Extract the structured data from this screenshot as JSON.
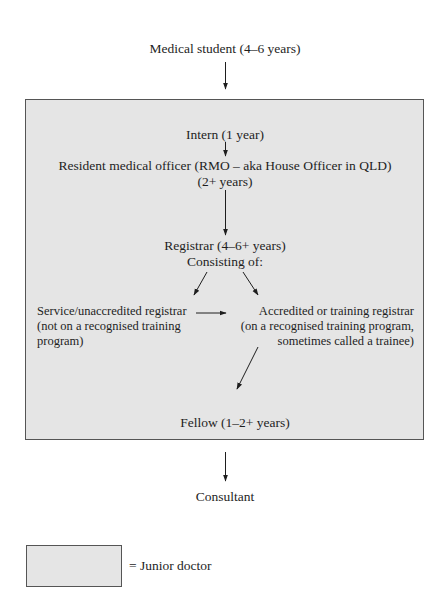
{
  "diagram": {
    "nodes": {
      "medical_student": "Medical student (4–6 years)",
      "intern": "Intern (1 year)",
      "rmo_line1": "Resident medical officer (RMO – aka House Officer in QLD)",
      "rmo_line2": "(2+ years)",
      "registrar_line1": "Registrar (4–6+ years)",
      "registrar_line2": "Consisting of:",
      "service_registrar": [
        "Service/unaccredited registrar",
        "(not on a recognised training",
        "program)"
      ],
      "accredited_registrar": [
        "Accredited or training registrar",
        "(on a recognised training program,",
        "sometimes called a trainee)"
      ],
      "fellow": "Fellow (1–2+ years)",
      "consultant": "Consultant"
    },
    "edges": [
      {
        "from": "medical_student",
        "to": "intern"
      },
      {
        "from": "intern",
        "to": "rmo"
      },
      {
        "from": "rmo",
        "to": "registrar"
      },
      {
        "from": "registrar",
        "to": "service_registrar"
      },
      {
        "from": "registrar",
        "to": "accredited_registrar"
      },
      {
        "from": "service_registrar",
        "to": "accredited_registrar"
      },
      {
        "from": "accredited_registrar",
        "to": "fellow"
      },
      {
        "from": "fellow",
        "to": "consultant"
      }
    ],
    "group": {
      "label": "Junior doctor",
      "members": [
        "intern",
        "rmo",
        "registrar",
        "service_registrar",
        "accredited_registrar",
        "fellow"
      ],
      "fill_color": "#e5e5e5",
      "border_color": "#555555"
    },
    "legend": {
      "text": "= Junior doctor"
    }
  }
}
